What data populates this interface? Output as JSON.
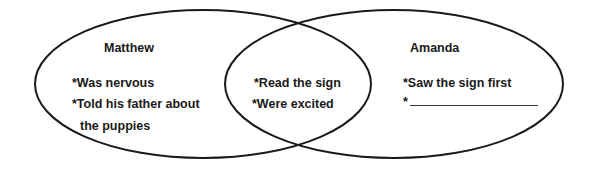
{
  "diagram": {
    "type": "venn",
    "left": {
      "title": "Matthew",
      "items": [
        "*Was nervous",
        "*Told his father about",
        " the puppies"
      ]
    },
    "middle": {
      "items": [
        "*Read the sign",
        "*Were excited"
      ]
    },
    "right": {
      "title": "Amanda",
      "items": [
        "*Saw the sign first",
        "*"
      ]
    },
    "stroke_color": "#1a1a1a"
  }
}
